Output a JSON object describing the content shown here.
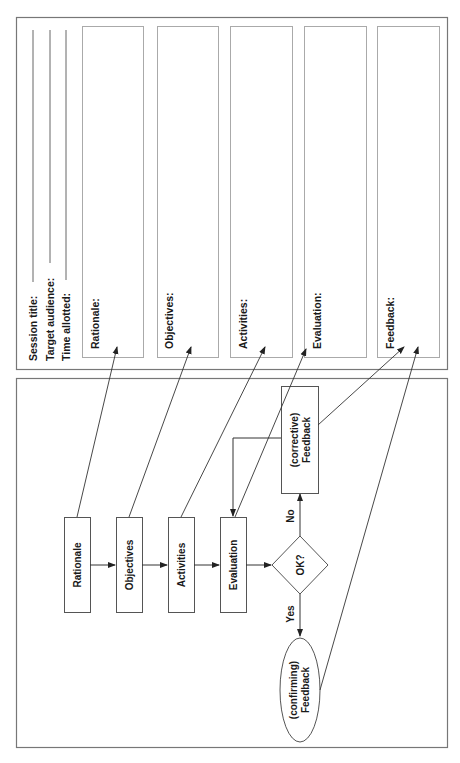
{
  "form": {
    "header_fields": [
      {
        "label": "Session title:"
      },
      {
        "label": "Target audience:"
      },
      {
        "label": "Time allotted:"
      }
    ],
    "sections": [
      {
        "label": "Rationale:"
      },
      {
        "label": "Objectives:"
      },
      {
        "label": "Activities:"
      },
      {
        "label": "Evaluation:"
      },
      {
        "label": "Feedback:"
      }
    ]
  },
  "flowchart": {
    "steps": [
      {
        "label": "Rationale"
      },
      {
        "label": "Objectives"
      },
      {
        "label": "Activities"
      },
      {
        "label": "Evaluation"
      }
    ],
    "decision": {
      "label": "OK?"
    },
    "no_branch": {
      "label": "No",
      "node_line1": "(corrective)",
      "node_line2": "Feedback"
    },
    "yes_branch": {
      "label": "Yes",
      "node_line1": "(confirming)",
      "node_line2": "Feedback"
    }
  },
  "colors": {
    "stroke": "#555555",
    "light_stroke": "#aaaaaa",
    "text": "#1a1a1a"
  }
}
